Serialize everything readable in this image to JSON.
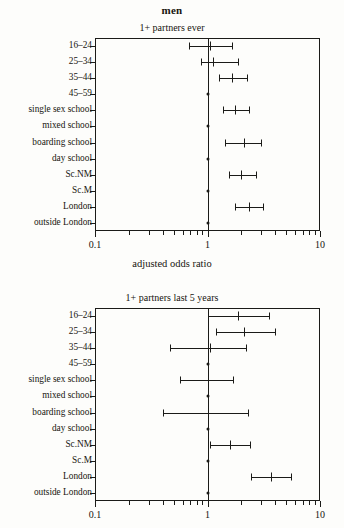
{
  "figure": {
    "title": "men",
    "axis_caption": "adjusted odds ratio"
  },
  "chart_data": [
    {
      "type": "forest",
      "title": "1+ partners ever",
      "xlabel": "adjusted odds ratio",
      "ylabel": "",
      "xscale": "log",
      "xlim": [
        0.1,
        10
      ],
      "xticks": [
        0.1,
        1,
        10
      ],
      "xticklabels": [
        "0.1",
        "1",
        "10"
      ],
      "grid": false,
      "reference_line": 1,
      "categories": [
        "16–24",
        "25–34",
        "35–44",
        "45–59",
        "single sex school",
        "mixed school",
        "boarding school",
        "day school",
        "Sc.NM",
        "Sc.M",
        "London",
        "outside London"
      ],
      "points": [
        {
          "label": "16–24",
          "or": 1.05,
          "lower": 0.68,
          "upper": 1.65,
          "reference": false
        },
        {
          "label": "25–34",
          "or": 1.12,
          "lower": 0.87,
          "upper": 1.85,
          "reference": false
        },
        {
          "label": "35–44",
          "or": 1.65,
          "lower": 1.27,
          "upper": 2.25,
          "reference": false
        },
        {
          "label": "45–59",
          "or": 1.0,
          "lower": null,
          "upper": null,
          "reference": true
        },
        {
          "label": "single sex school",
          "or": 1.75,
          "lower": 1.37,
          "upper": 2.35,
          "reference": false
        },
        {
          "label": "mixed school",
          "or": 1.0,
          "lower": null,
          "upper": null,
          "reference": true
        },
        {
          "label": "boarding school",
          "or": 2.1,
          "lower": 1.42,
          "upper": 3.0,
          "reference": false
        },
        {
          "label": "day school",
          "or": 1.0,
          "lower": null,
          "upper": null,
          "reference": true
        },
        {
          "label": "Sc.NM",
          "or": 2.0,
          "lower": 1.54,
          "upper": 2.7,
          "reference": false
        },
        {
          "label": "Sc.M",
          "or": 1.0,
          "lower": null,
          "upper": null,
          "reference": true
        },
        {
          "label": "London",
          "or": 2.35,
          "lower": 1.75,
          "upper": 3.1,
          "reference": false
        },
        {
          "label": "outside London",
          "or": 1.0,
          "lower": null,
          "upper": null,
          "reference": true
        }
      ]
    },
    {
      "type": "forest",
      "title": "1+ partners last 5 years",
      "xlabel": "adjusted odds ratio",
      "ylabel": "",
      "xscale": "log",
      "xlim": [
        0.1,
        10
      ],
      "xticks": [
        0.1,
        1,
        10
      ],
      "xticklabels": [
        "0.1",
        "1",
        "10"
      ],
      "grid": false,
      "reference_line": 1,
      "categories": [
        "16–24",
        "25–34",
        "35–44",
        "45–59",
        "single sex school",
        "mixed school",
        "boarding school",
        "day school",
        "Sc.NM",
        "Sc.M",
        "London",
        "outside London"
      ],
      "points": [
        {
          "label": "16–24",
          "or": 1.85,
          "lower": 1.0,
          "upper": 3.55,
          "reference": false
        },
        {
          "label": "25–34",
          "or": 2.1,
          "lower": 1.2,
          "upper": 3.95,
          "reference": false
        },
        {
          "label": "35–44",
          "or": 1.05,
          "lower": 0.46,
          "upper": 2.2,
          "reference": false
        },
        {
          "label": "45–59",
          "or": 1.0,
          "lower": null,
          "upper": null,
          "reference": true
        },
        {
          "label": "single sex school",
          "or": 1.0,
          "lower": 0.57,
          "upper": 1.7,
          "reference": false
        },
        {
          "label": "mixed school",
          "or": 1.0,
          "lower": null,
          "upper": null,
          "reference": true
        },
        {
          "label": "boarding school",
          "or": 1.0,
          "lower": 0.4,
          "upper": 2.3,
          "reference": false
        },
        {
          "label": "day school",
          "or": 1.0,
          "lower": null,
          "upper": null,
          "reference": true
        },
        {
          "label": "Sc.NM",
          "or": 1.6,
          "lower": 1.05,
          "upper": 2.4,
          "reference": false
        },
        {
          "label": "Sc.M",
          "or": 1.0,
          "lower": null,
          "upper": null,
          "reference": true
        },
        {
          "label": "London",
          "or": 3.7,
          "lower": 2.45,
          "upper": 5.5,
          "reference": false
        },
        {
          "label": "outside London",
          "or": 1.0,
          "lower": null,
          "upper": null,
          "reference": true
        }
      ]
    }
  ]
}
